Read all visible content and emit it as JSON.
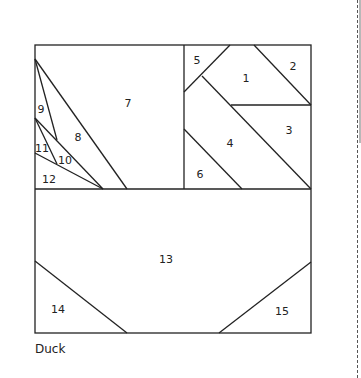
{
  "caption": "Duck",
  "pieces": [
    {
      "id": "1",
      "label": "1",
      "x": 246,
      "y": 79
    },
    {
      "id": "2",
      "label": "2",
      "x": 293,
      "y": 67
    },
    {
      "id": "3",
      "label": "3",
      "x": 289,
      "y": 131
    },
    {
      "id": "4",
      "label": "4",
      "x": 230,
      "y": 144
    },
    {
      "id": "5",
      "label": "5",
      "x": 197,
      "y": 61
    },
    {
      "id": "6",
      "label": "6",
      "x": 200,
      "y": 175
    },
    {
      "id": "7",
      "label": "7",
      "x": 128,
      "y": 104
    },
    {
      "id": "8",
      "label": "8",
      "x": 78,
      "y": 138
    },
    {
      "id": "9",
      "label": "9",
      "x": 41,
      "y": 110
    },
    {
      "id": "10",
      "label": "10",
      "x": 65,
      "y": 161
    },
    {
      "id": "11",
      "label": "11",
      "x": 42,
      "y": 149
    },
    {
      "id": "12",
      "label": "12",
      "x": 49,
      "y": 180
    },
    {
      "id": "13",
      "label": "13",
      "x": 166,
      "y": 260
    },
    {
      "id": "14",
      "label": "14",
      "x": 58,
      "y": 310
    },
    {
      "id": "15",
      "label": "15",
      "x": 282,
      "y": 312
    }
  ],
  "colors": {
    "stroke": "#222222",
    "dash": "#555555",
    "bar": "#b8b8b8"
  }
}
